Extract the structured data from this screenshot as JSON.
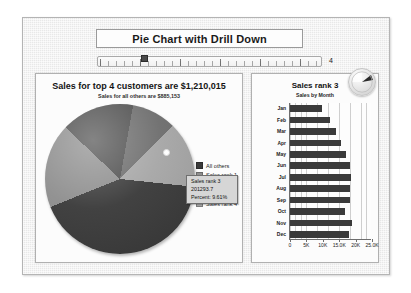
{
  "app": {
    "title": "Pie Chart with Drill Down"
  },
  "slider": {
    "name": "drill-down-slider",
    "value": "4",
    "min": 1,
    "max": 12
  },
  "left_panel": {
    "title": "Sales for top 4 customers are $1,210,015",
    "subtitle": "Sales for all others are $885,153",
    "tooltip": {
      "line1": "Sales rank 3",
      "line2": "201293.7",
      "line3": "Percent:  9.61%"
    },
    "legend": [
      {
        "label": "All others",
        "color": "#3a3a3a"
      },
      {
        "label": "Sales rank 1",
        "color": "#8e8e8e"
      },
      {
        "label": "Sales rank 2",
        "color": "#4f4f4f"
      },
      {
        "label": "Sales rank 3",
        "color": "#6d6d6d"
      },
      {
        "label": "Sales rank 4",
        "color": "#a6a6a6"
      }
    ]
  },
  "right_panel": {
    "title": "Sales rank 3",
    "subtitle": "Sales by Month",
    "badge_icon": "pie-slice-pointer-icon"
  },
  "chart_data": [
    {
      "type": "pie",
      "title": "Sales for top 4 customers are $1,210,015",
      "subtitle": "Sales for all others are $885,153",
      "labels": [
        "All others",
        "Sales rank 1",
        "Sales rank 2",
        "Sales rank 3",
        "Sales rank 4"
      ],
      "values": [
        885153,
        380000,
        330000,
        201294,
        298721
      ],
      "percents": [
        42.3,
        18.1,
        15.8,
        9.61,
        14.2
      ],
      "colors": [
        "#3a3a3a",
        "#8e8e8e",
        "#4f4f4f",
        "#6d6d6d",
        "#a6a6a6"
      ],
      "legend_position": "right",
      "selected_slice": "Sales rank 3",
      "annotation": "Sales rank 3 / 201293.7 / Percent:  9.61%"
    },
    {
      "type": "bar",
      "orientation": "horizontal",
      "title": "Sales rank 3",
      "subtitle": "Sales by Month",
      "xlabel": "",
      "ylabel": "",
      "categories": [
        "Jan",
        "Feb",
        "Mar",
        "Apr",
        "May",
        "Jun",
        "Jul",
        "Aug",
        "Sep",
        "Oct",
        "Nov",
        "Dec"
      ],
      "values": [
        9800,
        12200,
        13900,
        15600,
        17000,
        18300,
        18600,
        18200,
        18200,
        16700,
        19000,
        17900
      ],
      "xlim": [
        0,
        25000
      ],
      "xticks": [
        0,
        5000,
        10000,
        15000,
        20000,
        25000
      ],
      "xticklabels": [
        "0",
        "5K",
        "10K",
        "15.0K",
        "20K",
        "25.0K"
      ],
      "grid": true,
      "bar_color": "#3a3a3a"
    }
  ]
}
